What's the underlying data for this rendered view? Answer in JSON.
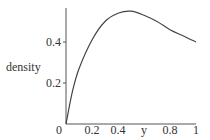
{
  "chart_data": {
    "type": "line",
    "title": "",
    "xlabel": "y",
    "ylabel": "density",
    "xlim": [
      0,
      1
    ],
    "ylim": [
      0,
      0.55
    ],
    "grid": false,
    "legend": null,
    "x_ticks": [
      "0.2",
      "0.4",
      "0.8",
      "1"
    ],
    "y_ticks": [
      "0.2",
      "0.4"
    ],
    "origin_label": "0",
    "series": [
      {
        "name": "density",
        "x": [
          0,
          0.05,
          0.1,
          0.2,
          0.3,
          0.4,
          0.5,
          0.6,
          0.7,
          0.8,
          0.9,
          1.0
        ],
        "values": [
          0,
          0.16,
          0.27,
          0.41,
          0.5,
          0.54,
          0.55,
          0.53,
          0.5,
          0.46,
          0.43,
          0.4
        ]
      }
    ]
  },
  "colors": {
    "axis": "#555555",
    "curve": "#444444",
    "text": "#333333"
  }
}
